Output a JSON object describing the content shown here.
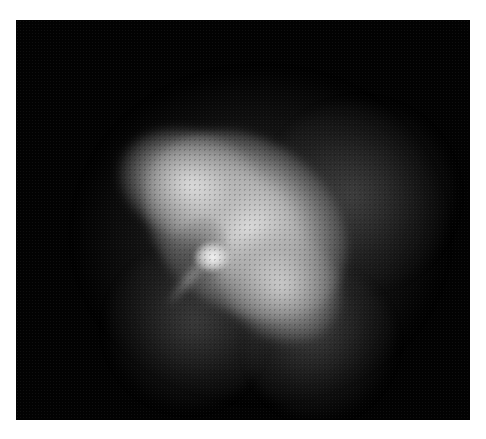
{
  "image": {
    "subject": "X-ray nebula (pulsar wind nebula) in greyscale",
    "palette": {
      "page_background": "#ffffff",
      "field_background": "#020202",
      "nebula_bright": "#ebebeb",
      "nebula_mid": "#8c8c8c",
      "nebula_faint": "#505050"
    },
    "frame": {
      "x": 16,
      "y": 20,
      "width": 454,
      "height": 400
    },
    "visible_text": []
  }
}
